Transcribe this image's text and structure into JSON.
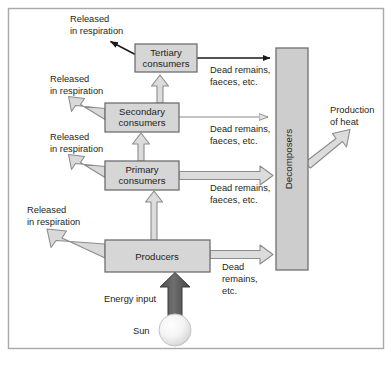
{
  "diagram": {
    "colors": {
      "box_fill": "#d4d4d4",
      "box_stroke": "#6f6f6f",
      "decomposer_fill": "#c9c9c9",
      "hollow_arrow_fill": "#d6d6d6",
      "hollow_arrow_stroke": "#8a8a8a",
      "solid_arrow": "#1a1a1a",
      "energy_arrow": "#5a5a5a",
      "sun_core": "#ffffff",
      "sun_edge": "#c6c6c6",
      "frame_stroke": "#a9a9a9",
      "text": "#231f20"
    },
    "boxes": [
      {
        "id": "tertiary",
        "label_line1": "Tertiary",
        "label_line2": "consumers",
        "x": 135,
        "y": 44,
        "w": 62,
        "h": 28
      },
      {
        "id": "secondary",
        "label_line1": "Secondary",
        "label_line2": "consumers",
        "x": 105,
        "y": 103,
        "w": 74,
        "h": 29
      },
      {
        "id": "primary",
        "label_line1": "Primary",
        "label_line2": "consumers",
        "x": 105,
        "y": 161,
        "w": 74,
        "h": 29
      },
      {
        "id": "producers",
        "label_line1": "Producers",
        "label_line2": "",
        "x": 105,
        "y": 240,
        "w": 105,
        "h": 32
      },
      {
        "id": "decomposers",
        "label_line1": "Decomposers",
        "label_line2": "",
        "x": 276,
        "y": 48,
        "w": 32,
        "h": 222
      }
    ],
    "respiration_labels": [
      {
        "id": "resp-tertiary",
        "line1": "Released",
        "line2": "in respiration",
        "x": 70,
        "y": 22
      },
      {
        "id": "resp-secondary",
        "line1": "Released",
        "line2": "in respiration",
        "x": 50,
        "y": 82
      },
      {
        "id": "resp-primary",
        "line1": "Released",
        "line2": "in respiration",
        "x": 50,
        "y": 140
      },
      {
        "id": "resp-producers",
        "line1": "Released",
        "line2": "in respiration",
        "x": 27,
        "y": 213
      }
    ],
    "dead_remains_labels": [
      {
        "id": "dead-tertiary",
        "line1": "Dead remains,",
        "line2": "faeces, etc.",
        "line3": "",
        "x": 210,
        "y": 65
      },
      {
        "id": "dead-secondary",
        "line1": "Dead remains,",
        "line2": "faeces, etc.",
        "line3": "",
        "x": 210,
        "y": 124
      },
      {
        "id": "dead-primary",
        "line1": "Dead remains,",
        "line2": "faeces, etc.",
        "line3": "",
        "x": 210,
        "y": 183
      },
      {
        "id": "dead-producers",
        "line1": "Dead",
        "line2": "remains,",
        "line3": "etc.",
        "x": 222,
        "y": 268
      }
    ],
    "heat": {
      "line1": "Production",
      "line2": "of heat",
      "x": 330,
      "y": 113
    },
    "energy_input": {
      "label": "Energy input",
      "x": 104,
      "y": 302
    },
    "sun": {
      "label": "Sun",
      "label_x": 133,
      "label_y": 334,
      "cx": 175,
      "cy": 330,
      "r": 16
    }
  }
}
